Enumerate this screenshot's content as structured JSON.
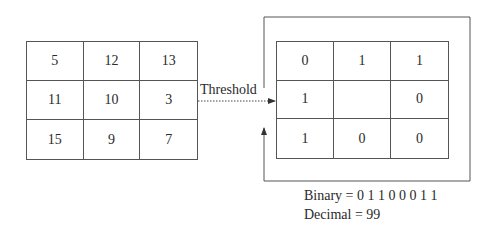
{
  "diagram": {
    "type": "local-binary-pattern",
    "input_grid": {
      "rows": [
        [
          "5",
          "12",
          "13"
        ],
        [
          "11",
          "10",
          "3"
        ],
        [
          "15",
          "9",
          "7"
        ]
      ]
    },
    "operation_label": "Threshold",
    "output_grid": {
      "rows": [
        [
          "0",
          "1",
          "1"
        ],
        [
          "1",
          "",
          "0"
        ],
        [
          "1",
          "0",
          "0"
        ]
      ]
    },
    "result": {
      "binary_label": "Binary = 0 1 1 0 0 0 1 1",
      "decimal_label": "Decimal = 99"
    },
    "colors": {
      "line": "#555555",
      "text": "#2a2a2a",
      "background": "#ffffff"
    }
  }
}
